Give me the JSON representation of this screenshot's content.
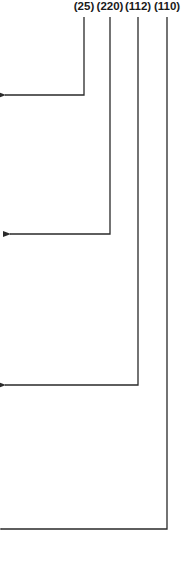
{
  "diagram": {
    "type": "reference-numeral-leaders",
    "line_color": "#2a2a2a",
    "labels": [
      {
        "text": "(25)",
        "x": 84,
        "turn_y": 95,
        "tip_x": 4
      },
      {
        "text": "(220)",
        "x": 110,
        "turn_y": 234,
        "tip_x": 9
      },
      {
        "text": "(112)",
        "x": 138,
        "turn_y": 385,
        "tip_x": 4
      },
      {
        "text": "(110)",
        "x": 167,
        "turn_y": 529,
        "tip_x": 0
      }
    ]
  }
}
